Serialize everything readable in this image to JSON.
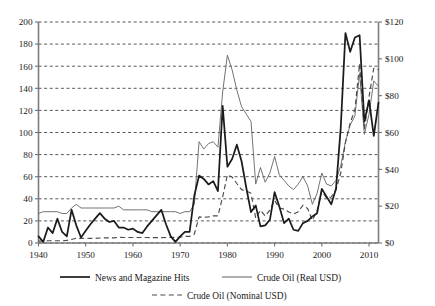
{
  "chart_data": {
    "type": "line",
    "title": "",
    "subtitle": "",
    "xlabel": "",
    "ylabel": "",
    "y2label": "",
    "grid": true,
    "legend_position": "bottom",
    "xlim": [
      1940,
      2012
    ],
    "x_ticks": [
      1940,
      1950,
      1960,
      1970,
      1980,
      1990,
      2000,
      2010
    ],
    "x_tick_labels": [
      "1940",
      "1950",
      "1960",
      "1970",
      "1980",
      "1990",
      "2000",
      "2010"
    ],
    "ylim": [
      0,
      200
    ],
    "y_ticks": [
      0,
      20,
      40,
      60,
      80,
      100,
      120,
      140,
      160,
      180,
      200
    ],
    "y_tick_labels": [
      "0",
      "20",
      "40",
      "60",
      "80",
      "100",
      "120",
      "140",
      "160",
      "180",
      "200"
    ],
    "y2lim": [
      0,
      120
    ],
    "y2_ticks": [
      0,
      20,
      40,
      60,
      80,
      100,
      120
    ],
    "y2_tick_labels": [
      "$0",
      "$20",
      "$40",
      "$60",
      "$80",
      "$100",
      "$120"
    ],
    "series": [
      {
        "name": "News and Magazine Hits",
        "axis": "left",
        "style": "solid-thick",
        "color": "#1b1b1b",
        "x": [
          1940,
          1941,
          1942,
          1943,
          1944,
          1945,
          1946,
          1947,
          1948,
          1949,
          1950,
          1951,
          1952,
          1953,
          1954,
          1955,
          1956,
          1957,
          1958,
          1959,
          1960,
          1961,
          1962,
          1963,
          1964,
          1965,
          1966,
          1967,
          1968,
          1969,
          1970,
          1971,
          1972,
          1973,
          1974,
          1975,
          1976,
          1977,
          1978,
          1979,
          1980,
          1981,
          1982,
          1983,
          1984,
          1985,
          1986,
          1987,
          1988,
          1989,
          1990,
          1991,
          1992,
          1993,
          1994,
          1995,
          1996,
          1997,
          1998,
          1999,
          2000,
          2001,
          2002,
          2003,
          2004,
          2005,
          2006,
          2007,
          2008,
          2009,
          2010,
          2011,
          2012
        ],
        "values": [
          6,
          1,
          14,
          9,
          22,
          10,
          6,
          30,
          16,
          5,
          11,
          17,
          22,
          27,
          22,
          19,
          20,
          14,
          14,
          12,
          13,
          10,
          9,
          15,
          20,
          25,
          30,
          17,
          6,
          1,
          6,
          10,
          10,
          43,
          61,
          58,
          53,
          56,
          47,
          124,
          69,
          76,
          89,
          74,
          50,
          28,
          34,
          15,
          16,
          21,
          46,
          33,
          18,
          22,
          12,
          11,
          18,
          20,
          24,
          27,
          49,
          42,
          35,
          49,
          104,
          190,
          173,
          186,
          188,
          110,
          129,
          97,
          127
        ]
      },
      {
        "name": "Crude Oil (Real USD)",
        "axis": "right",
        "style": "solid-thin",
        "color": "#6b6b6b",
        "x": [
          1940,
          1941,
          1942,
          1943,
          1944,
          1945,
          1946,
          1947,
          1948,
          1949,
          1950,
          1951,
          1952,
          1953,
          1954,
          1955,
          1956,
          1957,
          1958,
          1959,
          1960,
          1961,
          1962,
          1963,
          1964,
          1965,
          1966,
          1967,
          1968,
          1969,
          1970,
          1971,
          1972,
          1973,
          1974,
          1975,
          1976,
          1977,
          1978,
          1979,
          1980,
          1981,
          1982,
          1983,
          1984,
          1985,
          1986,
          1987,
          1988,
          1989,
          1990,
          1991,
          1992,
          1993,
          1994,
          1995,
          1996,
          1997,
          1998,
          1999,
          2000,
          2001,
          2002,
          2003,
          2004,
          2005,
          2006,
          2007,
          2008,
          2009,
          2010,
          2011,
          2012
        ],
        "values": [
          16,
          17,
          17,
          17,
          17,
          16,
          16,
          19,
          21,
          19,
          19,
          19,
          19,
          19,
          19,
          19,
          19,
          20,
          18,
          18,
          18,
          18,
          18,
          18,
          17,
          17,
          17,
          17,
          17,
          17,
          16,
          17,
          17,
          21,
          55,
          51,
          54,
          55,
          52,
          82,
          102,
          94,
          83,
          74,
          70,
          66,
          32,
          41,
          33,
          38,
          47,
          37,
          34,
          31,
          29,
          32,
          36,
          31,
          21,
          27,
          38,
          32,
          31,
          34,
          42,
          55,
          64,
          69,
          92,
          59,
          70,
          88,
          85
        ]
      },
      {
        "name": "Crude Oil (Nominal USD)",
        "axis": "right",
        "style": "dashed",
        "color": "#4a4a4a",
        "x": [
          1940,
          1941,
          1942,
          1943,
          1944,
          1945,
          1946,
          1947,
          1948,
          1949,
          1950,
          1951,
          1952,
          1953,
          1954,
          1955,
          1956,
          1957,
          1958,
          1959,
          1960,
          1961,
          1962,
          1963,
          1964,
          1965,
          1966,
          1967,
          1968,
          1969,
          1970,
          1971,
          1972,
          1973,
          1974,
          1975,
          1976,
          1977,
          1978,
          1979,
          1980,
          1981,
          1982,
          1983,
          1984,
          1985,
          1986,
          1987,
          1988,
          1989,
          1990,
          1991,
          1992,
          1993,
          1994,
          1995,
          1996,
          1997,
          1998,
          1999,
          2000,
          2001,
          2002,
          2003,
          2004,
          2005,
          2006,
          2007,
          2008,
          2009,
          2010,
          2011,
          2012
        ],
        "values": [
          1.0,
          1.1,
          1.2,
          1.2,
          1.2,
          1.2,
          1.4,
          1.9,
          2.6,
          2.5,
          2.6,
          2.5,
          2.5,
          2.7,
          2.8,
          2.8,
          2.8,
          3.1,
          3.0,
          3.0,
          3.0,
          3.0,
          3.0,
          3.0,
          2.9,
          2.9,
          2.9,
          3.0,
          3.0,
          3.1,
          3.2,
          3.6,
          3.6,
          4.8,
          14.2,
          13.9,
          14.2,
          14.8,
          14.7,
          25.1,
          37.0,
          35.8,
          32.3,
          29.0,
          28.2,
          27.0,
          13.5,
          17.8,
          14.7,
          17.9,
          23.2,
          19.0,
          18.4,
          16.8,
          15.7,
          17.0,
          20.5,
          18.7,
          12.3,
          17.5,
          28.3,
          24.4,
          25.0,
          28.8,
          38.0,
          54.5,
          65.1,
          72.4,
          97.3,
          61.7,
          79.5,
          94.9,
          94.1
        ]
      }
    ],
    "legend": [
      {
        "label": "News and Magazine Hits",
        "style": "solid-thick"
      },
      {
        "label": "Crude Oil (Real USD)",
        "style": "solid-thin"
      },
      {
        "label": "Crude Oil (Nominal USD)",
        "style": "dashed"
      }
    ]
  }
}
